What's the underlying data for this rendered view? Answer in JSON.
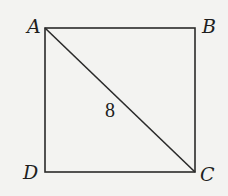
{
  "diagram": {
    "type": "square-with-diagonal",
    "vertices": {
      "A": {
        "label": "A",
        "x": 45,
        "y": 28
      },
      "B": {
        "label": "B",
        "x": 195,
        "y": 28
      },
      "C": {
        "label": "C",
        "x": 195,
        "y": 172
      },
      "D": {
        "label": "D",
        "x": 45,
        "y": 172
      }
    },
    "diagonal": {
      "from": "A",
      "to": "C",
      "length_label": "8"
    },
    "colors": {
      "background": "#f3f3f1",
      "stroke": "#2a2a2a",
      "text": "#1e1e1e"
    }
  }
}
